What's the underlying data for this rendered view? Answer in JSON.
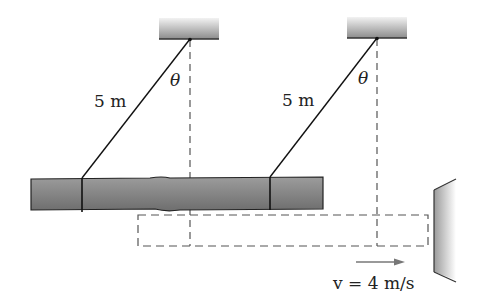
{
  "figure": {
    "type": "physics-diagram",
    "labels": {
      "rope_left_length": "5 m",
      "rope_right_length": "5 m",
      "angle_left": "θ",
      "angle_right": "θ",
      "velocity": "v = 4 m/s"
    },
    "colors": {
      "line": "#1a1a1a",
      "dashed": "#555555",
      "log_fill": "#8a8a8a",
      "ceiling_fill_top": "#e8e8e8",
      "ceiling_fill_bottom": "#8c8c8c",
      "arrow": "#777777"
    }
  }
}
